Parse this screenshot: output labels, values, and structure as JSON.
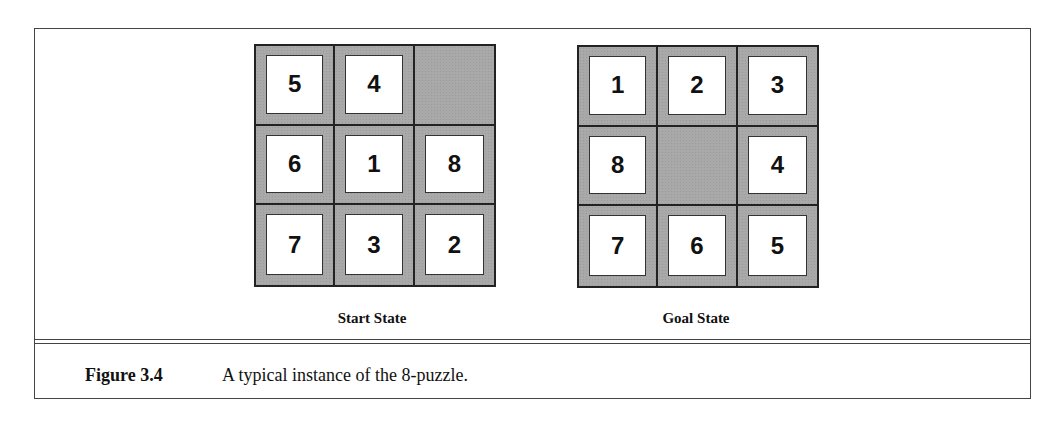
{
  "figure": {
    "number": "Figure 3.4",
    "caption": "A typical instance of the 8-puzzle."
  },
  "start_state": {
    "label": "Start State",
    "tiles": [
      "5",
      "4",
      "",
      "6",
      "1",
      "8",
      "7",
      "3",
      "2"
    ]
  },
  "goal_state": {
    "label": "Goal State",
    "tiles": [
      "1",
      "2",
      "3",
      "8",
      "",
      "4",
      "7",
      "6",
      "5"
    ]
  },
  "colors": {
    "blank_cell": "#a9a9a9",
    "tile": "#ffffff",
    "border": "#222222"
  }
}
